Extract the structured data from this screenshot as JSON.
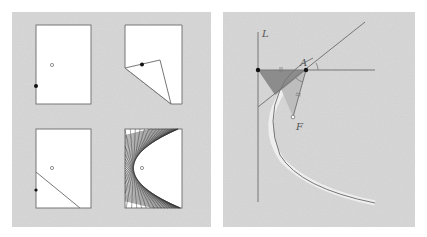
{
  "figure": {
    "left_panel": {
      "description": "Paper folding steps producing a parabola",
      "sheets": [
        {
          "id": "step-1",
          "x": 36,
          "y": 25,
          "w": 55,
          "h": 79,
          "focus": [
            52,
            65
          ],
          "point": [
            36,
            86
          ]
        },
        {
          "id": "step-2",
          "x": 125,
          "y": 25,
          "w": 57,
          "h": 79,
          "fold_triangle": [
            [
              125,
              68
            ],
            [
              160,
              60
            ],
            [
              171,
              104
            ]
          ],
          "point": [
            142,
            65
          ]
        },
        {
          "id": "step-3",
          "x": 36,
          "y": 129,
          "w": 55,
          "h": 79,
          "focus": [
            52,
            168
          ],
          "point": [
            36,
            190
          ],
          "crease": [
            [
              36,
              172
            ],
            [
              80,
              208
            ]
          ]
        },
        {
          "id": "step-4",
          "x": 125,
          "y": 129,
          "w": 57,
          "h": 79,
          "focus": [
            142,
            168
          ],
          "envelope": "parabola"
        }
      ]
    },
    "right_panel": {
      "description": "Geometry of the crease as tangent to parabola",
      "labels": {
        "directrix": "L",
        "point_a": "A",
        "focus": "F",
        "tick_top": "=",
        "tick_side": "="
      },
      "colors": {
        "line": "#777777",
        "shade_dark": "#8c8c8c",
        "shade_light": "#bdbdbd",
        "dot": "#111111"
      }
    }
  }
}
